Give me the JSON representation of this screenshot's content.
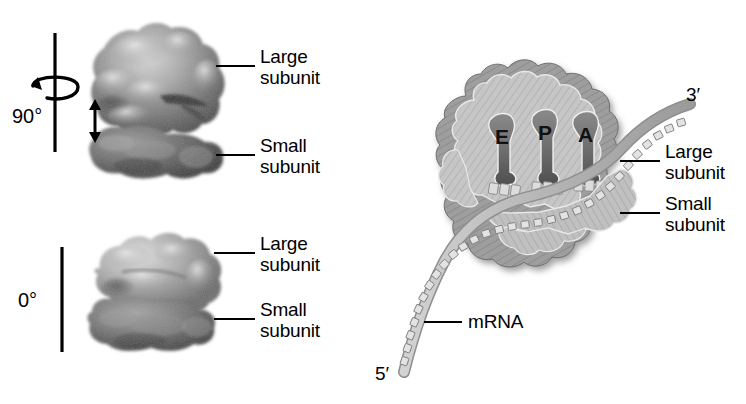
{
  "figure": {
    "background_color": "#ffffff",
    "ink_color": "#000000"
  },
  "panels": {
    "left_top": {
      "name": "dissociated-subunits-90deg",
      "rotation_label": "90°",
      "labels": [
        {
          "text": "Large\nsubunit",
          "target": "large-subunit"
        },
        {
          "text": "Small\nsubunit",
          "target": "small-subunit"
        }
      ]
    },
    "left_bottom": {
      "name": "assembled-ribosome-0deg",
      "rotation_label": "0°",
      "labels": [
        {
          "text": "Large\nsubunit",
          "target": "large-subunit"
        },
        {
          "text": "Small\nsubunit",
          "target": "small-subunit"
        }
      ]
    },
    "right": {
      "name": "ribosome-cross-section-with-mrna",
      "sites": [
        {
          "letter": "E",
          "meaning": "exit-site"
        },
        {
          "letter": "P",
          "meaning": "peptidyl-site"
        },
        {
          "letter": "A",
          "meaning": "aminoacyl-site"
        }
      ],
      "labels": [
        {
          "text": "Large\nsubunit",
          "target": "large-subunit"
        },
        {
          "text": "Small\nsubunit",
          "target": "small-subunit"
        },
        {
          "text": "mRNA",
          "target": "mrna-strand"
        }
      ],
      "mrna_ends": {
        "five_prime": "5′",
        "three_prime": "3′"
      }
    }
  },
  "colors": {
    "subunit_dark": "#4a4a4a",
    "subunit_mid": "#8a8a8a",
    "subunit_light": "#c9c9c9",
    "large_subunit_fill": "#c4c4c4",
    "small_subunit_fill": "#bdbdbd",
    "pocket_fill": "#6e6e6e",
    "mrna_fill": "#b8b8b8",
    "outline": "#000000"
  }
}
